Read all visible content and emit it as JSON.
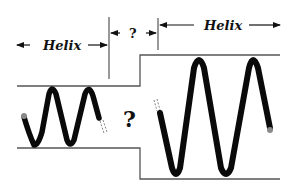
{
  "figure": {
    "labels": {
      "left_segment": "Helix",
      "middle_segment": "?",
      "right_segment": "Helix",
      "center_question": "?"
    },
    "colors": {
      "helix": "#0a0a0a",
      "boundary_lines": "#555555",
      "end_cap": "#8a8a8a",
      "text": "#111111"
    }
  }
}
